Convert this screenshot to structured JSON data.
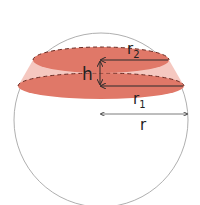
{
  "diagram": {
    "labels": {
      "r2": "r",
      "r2_sub": "2",
      "r1": "r",
      "r1_sub": "1",
      "h": "h",
      "r": "r"
    },
    "colors": {
      "segment_fill": "#E07868",
      "band_fill": "#F5C8C0",
      "sphere_stroke": "#9a9a9a",
      "arrow": "#2a2a2a",
      "dash": "#6a2a22"
    }
  }
}
